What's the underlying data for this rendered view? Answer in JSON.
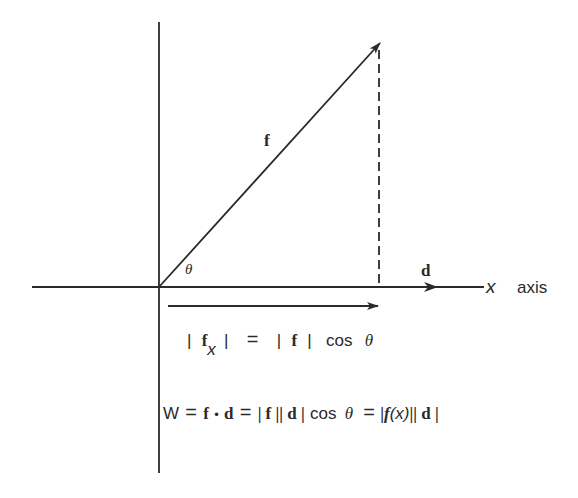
{
  "diagram": {
    "colors": {
      "ink": "#2a2a2a",
      "background": "#ffffff"
    },
    "axes": {
      "horizontal": {
        "label_var": "x",
        "label_word": "axis"
      },
      "vertical": {
        "label": ""
      }
    },
    "vectors": {
      "force": {
        "label": "f"
      },
      "displacement": {
        "label": "d"
      },
      "projection": {
        "label": "f_x"
      }
    },
    "angle": {
      "label": "θ"
    },
    "equations": {
      "projection": {
        "bar1": "|",
        "f": "f",
        "sub_x": "x",
        "bar2": "|",
        "equals": "=",
        "bar3": "|",
        "f2": "f",
        "bar4": "|",
        "cos": "cos",
        "theta": "θ"
      },
      "work": {
        "W": "W",
        "eq1": "=",
        "f": "f",
        "dot": "•",
        "d": "d",
        "eq2": "=",
        "absf": "| f | ",
        "absd": "| d |",
        "cos": "cos",
        "theta": "θ",
        "eq3": "=",
        "absfx_open": "| ",
        "fx_f": "f",
        "fx_arg": "(x)",
        "absfx_close": " |",
        "absd2": " | d |"
      }
    }
  }
}
